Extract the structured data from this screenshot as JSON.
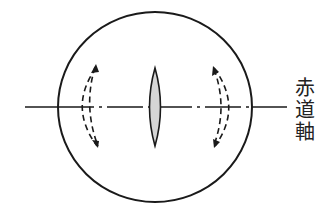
{
  "diagram": {
    "axis_label_chars": [
      "赤",
      "道",
      "軸"
    ],
    "colors": {
      "stroke": "#1a1a1a",
      "spindle_fill": "#d6d6d6",
      "background": "#ffffff"
    }
  }
}
